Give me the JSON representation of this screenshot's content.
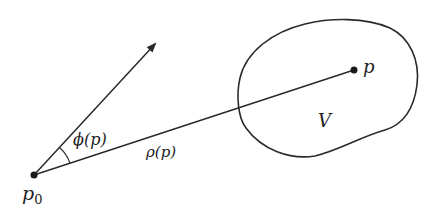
{
  "diagram": {
    "points": {
      "p0": {
        "label": "p",
        "subscript": "0",
        "x": 34,
        "y": 175
      },
      "p": {
        "label": "p",
        "x": 354,
        "y": 70
      }
    },
    "arrow": {
      "from": [
        34,
        175
      ],
      "to": [
        157,
        42
      ]
    },
    "labels": {
      "angle": "ϕ(p)",
      "distance": "ρ(p)",
      "region": "V",
      "point_p": "p",
      "point_p0_main": "p",
      "point_p0_sub": "0"
    },
    "colors": {
      "ink": "#2a2a2a",
      "background": "#ffffff"
    }
  }
}
